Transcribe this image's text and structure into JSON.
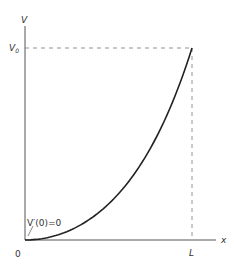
{
  "diagram": {
    "axes": {
      "y_label": "V",
      "y_marker_label": "V",
      "y_marker_subscript": "0",
      "x_label": "x",
      "x_marker_label": "L",
      "origin_label": "0"
    },
    "annotation": "V′(0)=0",
    "curve": {
      "description": "Monotonically increasing convex curve from (0,0) with zero slope at origin to (L, V0)",
      "function": "V(x) = V0 * (cosh(k x / L) - 1) / (cosh(k) - 1)",
      "k": 2.2
    },
    "colors": {
      "axis": "#555555",
      "curve": "#222222",
      "dashed": "#777777"
    }
  }
}
